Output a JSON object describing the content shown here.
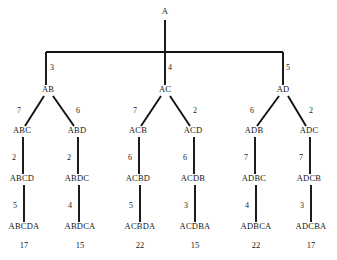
{
  "diagram": {
    "type": "tree",
    "background_color": "#ffffff",
    "line_color": "#111111",
    "text_color": "#161616"
  },
  "root": {
    "label": "A",
    "x": 165,
    "y": 14
  },
  "bus": {
    "y": 52,
    "x_left": 46,
    "x_right": 283,
    "root_x": 165
  },
  "level1": {
    "nodes": [
      {
        "id": "AB",
        "label": "AB",
        "x": 48,
        "y": 92,
        "cost": "3",
        "cost_x": 52,
        "cost_y": 70
      },
      {
        "id": "AC",
        "label": "AC",
        "x": 165,
        "y": 92,
        "cost": "4",
        "cost_x": 170,
        "cost_y": 70
      },
      {
        "id": "AD",
        "label": "AD",
        "x": 283,
        "y": 92,
        "cost": "5",
        "cost_x": 288,
        "cost_y": 70
      }
    ]
  },
  "level2": {
    "nodes": [
      {
        "id": "ABC",
        "label": "ABC",
        "x": 22,
        "y": 133,
        "parent": "AB",
        "cost": "7",
        "cost_x": 19,
        "cost_y": 113
      },
      {
        "id": "ABD",
        "label": "ABD",
        "x": 77,
        "y": 133,
        "parent": "AB",
        "cost": "6",
        "cost_x": 78,
        "cost_y": 113
      },
      {
        "id": "ACB",
        "label": "ACB",
        "x": 138,
        "y": 133,
        "parent": "AC",
        "cost": "7",
        "cost_x": 135,
        "cost_y": 113
      },
      {
        "id": "ACD",
        "label": "ACD",
        "x": 193,
        "y": 133,
        "parent": "AC",
        "cost": "2",
        "cost_x": 195,
        "cost_y": 113
      },
      {
        "id": "ADB",
        "label": "ADB",
        "x": 254,
        "y": 133,
        "parent": "AD",
        "cost": "6",
        "cost_x": 252,
        "cost_y": 113
      },
      {
        "id": "ADC",
        "label": "ADC",
        "x": 309,
        "y": 133,
        "parent": "AD",
        "cost": "2",
        "cost_x": 311,
        "cost_y": 113
      }
    ]
  },
  "level3": {
    "nodes": [
      {
        "id": "ABCD",
        "label": "ABCD",
        "x": 22,
        "y": 181,
        "parent": "ABC",
        "cost": "2",
        "cost_x": 14,
        "cost_y": 160
      },
      {
        "id": "ABDC",
        "label": "ABDC",
        "x": 77,
        "y": 181,
        "parent": "ABD",
        "cost": "2",
        "cost_x": 69,
        "cost_y": 160
      },
      {
        "id": "ACBD",
        "label": "ACBD",
        "x": 138,
        "y": 181,
        "parent": "ACB",
        "cost": "6",
        "cost_x": 130,
        "cost_y": 160
      },
      {
        "id": "ACDB",
        "label": "ACDB",
        "x": 193,
        "y": 181,
        "parent": "ACD",
        "cost": "6",
        "cost_x": 185,
        "cost_y": 160
      },
      {
        "id": "ADBC",
        "label": "ADBC",
        "x": 254,
        "y": 181,
        "parent": "ADB",
        "cost": "7",
        "cost_x": 246,
        "cost_y": 160
      },
      {
        "id": "ADCB",
        "label": "ADCB",
        "x": 309,
        "y": 181,
        "parent": "ADC",
        "cost": "7",
        "cost_x": 301,
        "cost_y": 160
      }
    ]
  },
  "level4": {
    "nodes": [
      {
        "id": "ABCDA",
        "label": "ABCDA",
        "x": 24,
        "y": 229,
        "parent": "ABCD",
        "cost": "5",
        "cost_x": 15,
        "cost_y": 208,
        "total": "17",
        "total_x": 24,
        "total_y": 248
      },
      {
        "id": "ABDCA",
        "label": "ABDCA",
        "x": 80,
        "y": 229,
        "parent": "ABDC",
        "cost": "4",
        "cost_x": 70,
        "cost_y": 208,
        "total": "15",
        "total_x": 80,
        "total_y": 248
      },
      {
        "id": "ACBDA",
        "label": "ACBDA",
        "x": 140,
        "y": 229,
        "parent": "ACBD",
        "cost": "5",
        "cost_x": 131,
        "cost_y": 208,
        "total": "22",
        "total_x": 140,
        "total_y": 248
      },
      {
        "id": "ACDBA",
        "label": "ACDBA",
        "x": 195,
        "y": 229,
        "parent": "ACDB",
        "cost": "3",
        "cost_x": 186,
        "cost_y": 208,
        "total": "15",
        "total_x": 195,
        "total_y": 248
      },
      {
        "id": "ADBCA",
        "label": "ADBCA",
        "x": 256,
        "y": 229,
        "parent": "ADBC",
        "cost": "4",
        "cost_x": 247,
        "cost_y": 208,
        "total": "22",
        "total_x": 256,
        "total_y": 248
      },
      {
        "id": "ADCBA",
        "label": "ADCBA",
        "x": 311,
        "y": 229,
        "parent": "ADCB",
        "cost": "3",
        "cost_x": 302,
        "cost_y": 208,
        "total": "17",
        "total_x": 311,
        "total_y": 248
      }
    ]
  },
  "edges": {
    "root_stem": {
      "x": 165,
      "y1": 20,
      "y2": 52
    },
    "bus_drops": [
      {
        "x": 46,
        "y1": 52,
        "y2": 85
      },
      {
        "x": 165,
        "y1": 52,
        "y2": 85
      },
      {
        "x": 283,
        "y1": 52,
        "y2": 85
      }
    ],
    "diagonals_l2": [
      {
        "x1": 44,
        "y1": 96,
        "x2": 25,
        "y2": 126
      },
      {
        "x1": 53,
        "y1": 96,
        "x2": 74,
        "y2": 126
      },
      {
        "x1": 161,
        "y1": 96,
        "x2": 141,
        "y2": 126
      },
      {
        "x1": 170,
        "y1": 96,
        "x2": 190,
        "y2": 126
      },
      {
        "x1": 279,
        "y1": 96,
        "x2": 257,
        "y2": 126
      },
      {
        "x1": 288,
        "y1": 96,
        "x2": 306,
        "y2": 126
      }
    ],
    "verticals_l3": [
      {
        "x": 23,
        "y1": 137,
        "y2": 174
      },
      {
        "x": 78,
        "y1": 137,
        "y2": 174
      },
      {
        "x": 139,
        "y1": 137,
        "y2": 174
      },
      {
        "x": 194,
        "y1": 137,
        "y2": 174
      },
      {
        "x": 255,
        "y1": 137,
        "y2": 174
      },
      {
        "x": 310,
        "y1": 137,
        "y2": 174
      }
    ],
    "verticals_l4": [
      {
        "x": 24,
        "y1": 185,
        "y2": 222
      },
      {
        "x": 79,
        "y1": 185,
        "y2": 222
      },
      {
        "x": 140,
        "y1": 185,
        "y2": 222
      },
      {
        "x": 195,
        "y1": 185,
        "y2": 222
      },
      {
        "x": 256,
        "y1": 185,
        "y2": 222
      },
      {
        "x": 311,
        "y1": 185,
        "y2": 222
      }
    ]
  },
  "chart_data": {
    "type": "tree",
    "root": "A",
    "paths": [
      {
        "path": "ABCDA",
        "edge_costs": [
          3,
          7,
          2,
          5
        ],
        "total": 17
      },
      {
        "path": "ABDCA",
        "edge_costs": [
          3,
          6,
          2,
          4
        ],
        "total": 15
      },
      {
        "path": "ACBDA",
        "edge_costs": [
          4,
          7,
          6,
          5
        ],
        "total": 22
      },
      {
        "path": "ACDBA",
        "edge_costs": [
          4,
          2,
          6,
          3
        ],
        "total": 15
      },
      {
        "path": "ADBCA",
        "edge_costs": [
          5,
          6,
          7,
          4
        ],
        "total": 22
      },
      {
        "path": "ADCBA",
        "edge_costs": [
          5,
          2,
          7,
          3
        ],
        "total": 17
      }
    ],
    "levels": [
      [
        "A"
      ],
      [
        "AB",
        "AC",
        "AD"
      ],
      [
        "ABC",
        "ABD",
        "ACB",
        "ACD",
        "ADB",
        "ADC"
      ],
      [
        "ABCD",
        "ABDC",
        "ACBD",
        "ACDB",
        "ADBC",
        "ADCB"
      ],
      [
        "ABCDA",
        "ABDCA",
        "ACBDA",
        "ACDBA",
        "ADBCA",
        "ADCBA"
      ]
    ],
    "totals": [
      17,
      15,
      22,
      15,
      22,
      17
    ]
  }
}
